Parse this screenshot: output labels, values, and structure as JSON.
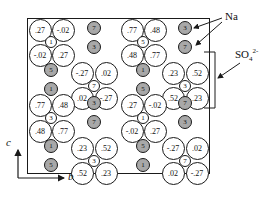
{
  "figure": {
    "labels": {
      "na": "Na",
      "sulfate": "SO",
      "sulfate_sub": "4",
      "sulfate_sup": "2-",
      "axis_c": "c",
      "axis_b": "b"
    },
    "colors": {
      "na_fill": "#a8a8a8",
      "ink": "#1a1a1a"
    },
    "oxygens": [
      {
        "x": 40,
        "y": 30,
        "v": ".27"
      },
      {
        "x": 63,
        "y": 30,
        "v": "-.02"
      },
      {
        "x": 40,
        "y": 55,
        "v": "-.02"
      },
      {
        "x": 63,
        "y": 55,
        "v": ".27"
      },
      {
        "x": 82,
        "y": 73,
        "v": "-.27"
      },
      {
        "x": 106,
        "y": 73,
        "v": ".02"
      },
      {
        "x": 82,
        "y": 98,
        "v": ".02"
      },
      {
        "x": 106,
        "y": 98,
        "v": "-.27"
      },
      {
        "x": 40,
        "y": 105,
        "v": ".77"
      },
      {
        "x": 63,
        "y": 105,
        "v": ".48"
      },
      {
        "x": 40,
        "y": 131,
        "v": ".48"
      },
      {
        "x": 63,
        "y": 131,
        "v": ".77"
      },
      {
        "x": 82,
        "y": 148,
        "v": ".23"
      },
      {
        "x": 106,
        "y": 148,
        "v": ".52"
      },
      {
        "x": 82,
        "y": 173,
        "v": ".52"
      },
      {
        "x": 106,
        "y": 173,
        "v": ".23"
      },
      {
        "x": 132,
        "y": 30,
        "v": ".77"
      },
      {
        "x": 155,
        "y": 30,
        "v": ".48"
      },
      {
        "x": 132,
        "y": 55,
        "v": ".48"
      },
      {
        "x": 155,
        "y": 55,
        "v": ".77"
      },
      {
        "x": 173,
        "y": 73,
        "v": ".23"
      },
      {
        "x": 197,
        "y": 73,
        "v": ".52"
      },
      {
        "x": 173,
        "y": 98,
        "v": ".52"
      },
      {
        "x": 197,
        "y": 98,
        "v": ".23"
      },
      {
        "x": 132,
        "y": 105,
        "v": ".27"
      },
      {
        "x": 155,
        "y": 105,
        "v": "-.02"
      },
      {
        "x": 132,
        "y": 131,
        "v": "-.02"
      },
      {
        "x": 155,
        "y": 131,
        "v": ".27"
      },
      {
        "x": 173,
        "y": 148,
        "v": "-.27"
      },
      {
        "x": 197,
        "y": 148,
        "v": ".02"
      },
      {
        "x": 173,
        "y": 173,
        "v": ".02"
      },
      {
        "x": 197,
        "y": 173,
        "v": "-.27"
      }
    ],
    "sulfur": [
      {
        "x": 51,
        "y": 42,
        "v": "1"
      },
      {
        "x": 94,
        "y": 86,
        "v": "7"
      },
      {
        "x": 51,
        "y": 118,
        "v": "3"
      },
      {
        "x": 94,
        "y": 161,
        "v": "3"
      },
      {
        "x": 143,
        "y": 42,
        "v": "5"
      },
      {
        "x": 185,
        "y": 86,
        "v": "3"
      },
      {
        "x": 143,
        "y": 118,
        "v": "1"
      },
      {
        "x": 185,
        "y": 161,
        "v": "7"
      }
    ],
    "sodium": [
      {
        "x": 94,
        "y": 28,
        "v": "7"
      },
      {
        "x": 94,
        "y": 47,
        "v": "3"
      },
      {
        "x": 51,
        "y": 70,
        "v": "5"
      },
      {
        "x": 51,
        "y": 89,
        "v": "1"
      },
      {
        "x": 94,
        "y": 103,
        "v": "3"
      },
      {
        "x": 94,
        "y": 122,
        "v": "7"
      },
      {
        "x": 51,
        "y": 146,
        "v": "1"
      },
      {
        "x": 51,
        "y": 165,
        "v": "5"
      },
      {
        "x": 185,
        "y": 28,
        "v": "3"
      },
      {
        "x": 185,
        "y": 47,
        "v": "7"
      },
      {
        "x": 143,
        "y": 70,
        "v": "1"
      },
      {
        "x": 143,
        "y": 89,
        "v": "5"
      },
      {
        "x": 185,
        "y": 103,
        "v": "7"
      },
      {
        "x": 185,
        "y": 122,
        "v": "3"
      },
      {
        "x": 143,
        "y": 146,
        "v": "5"
      },
      {
        "x": 143,
        "y": 165,
        "v": "1"
      }
    ]
  }
}
